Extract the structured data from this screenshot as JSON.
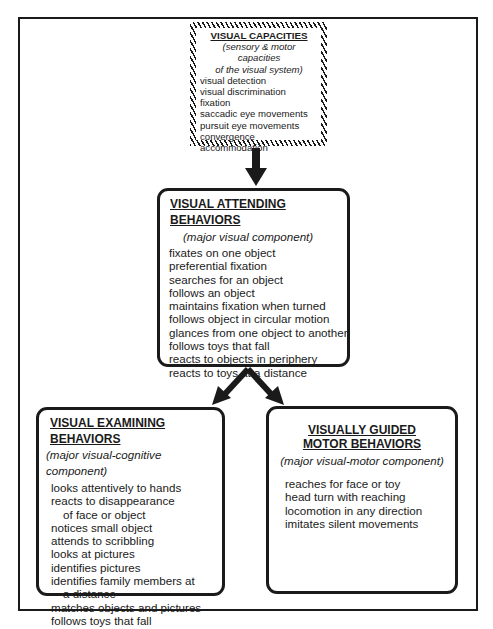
{
  "diagram": {
    "visual_capacities": {
      "title": "VISUAL CAPACITIES",
      "subtitle_line1": "(sensory & motor capacities",
      "subtitle_line2": "of the visual system)",
      "items": [
        "visual detection",
        "visual discrimination",
        "fixation",
        "saccadic eye movements",
        "pursuit eye movements",
        "convergence",
        "accommodation"
      ]
    },
    "visual_attending": {
      "title": "VISUAL ATTENDING BEHAVIORS",
      "subtitle": "(major visual component)",
      "items": [
        "fixates on one object",
        "preferential fixation",
        "searches for an object",
        "follows an object",
        "maintains fixation when turned",
        "follows object in circular motion",
        "glances from one object to another",
        "follows toys that fall",
        "reacts to objects in periphery",
        "reacts to toys at a distance"
      ]
    },
    "visual_examining": {
      "title": "VISUAL EXAMINING BEHAVIORS",
      "subtitle": "(major visual-cognitive component)",
      "items": [
        "looks attentively to hands",
        "reacts to disappearance",
        "of face or object",
        "notices small object",
        "attends to scribbling",
        "looks at pictures",
        "identifies pictures",
        "identifies family members at",
        "a distance",
        "matches objects and pictures",
        "follows toys that fall"
      ]
    },
    "visually_guided_motor": {
      "title_line1": "VISUALLY GUIDED",
      "title_line2": "MOTOR BEHAVIORS",
      "subtitle": "(major visual-motor component)",
      "items": [
        "reaches for face or toy",
        "head turn with reaching",
        "locomotion in any direction",
        "imitates silent movements"
      ]
    },
    "connections": [
      {
        "from": "visual_capacities",
        "to": "visual_attending"
      },
      {
        "from": "visual_attending",
        "to": "visual_examining"
      },
      {
        "from": "visual_attending",
        "to": "visually_guided_motor"
      }
    ]
  }
}
